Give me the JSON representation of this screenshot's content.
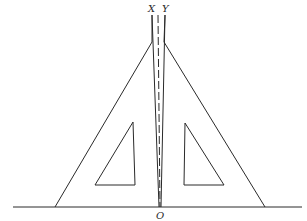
{
  "diagram": {
    "labels": {
      "left_edge": "X",
      "right_edge": "Y",
      "origin": "O"
    },
    "elements": [
      "baseline",
      "left-set-square",
      "right-set-square",
      "left-inner-cutout",
      "right-inner-cutout",
      "center-dashed-line"
    ],
    "colors": {
      "line": "#2a2a2a",
      "background": "#ffffff"
    }
  }
}
